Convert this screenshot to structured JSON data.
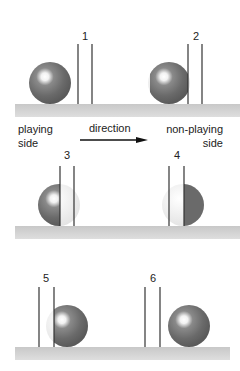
{
  "diagram": {
    "title": "",
    "panels": [
      {
        "number": "1",
        "ball_state": "before-posts"
      },
      {
        "number": "2",
        "ball_state": "touching-first-post"
      },
      {
        "number": "3",
        "ball_state": "between-posts-left"
      },
      {
        "number": "4",
        "ball_state": "between-posts-right"
      },
      {
        "number": "5",
        "ball_state": "touching-second-post"
      },
      {
        "number": "6",
        "ball_state": "past-posts"
      }
    ],
    "labels": {
      "playing_side_line1": "playing",
      "playing_side_line2": "side",
      "direction": "direction",
      "non_playing_side_line1": "non-playing",
      "non_playing_side_line2": "side"
    },
    "colors": {
      "ball": "#6e6e6e",
      "ball_highlight": "#ffffff",
      "ghost": "#e6e6e6",
      "post": "#333333",
      "ground": "#cfcfcf",
      "text": "#222222"
    }
  }
}
